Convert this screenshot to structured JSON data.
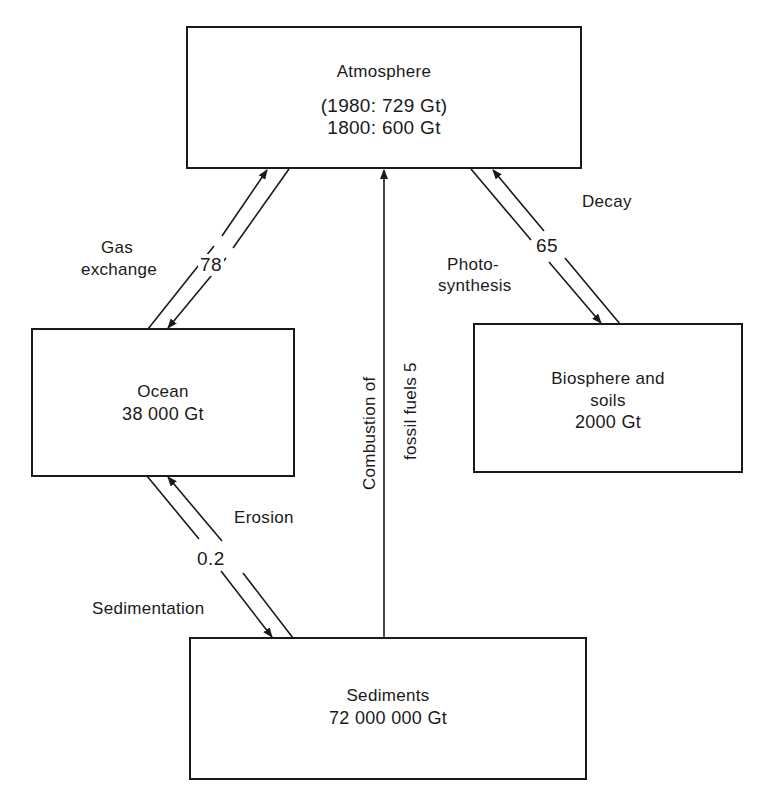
{
  "diagram": {
    "type": "carbon-cycle-flow",
    "colors": {
      "ink": "#1a1a1a",
      "background": "#ffffff"
    },
    "nodes": {
      "atmosphere": {
        "title": "Atmosphere",
        "line1": "(1980: 729 Gt)",
        "line2": "1800: 600 Gt"
      },
      "ocean": {
        "title": "Ocean",
        "line1": "38 000 Gt"
      },
      "biosphere": {
        "title": "Biosphere and",
        "line1": "soils",
        "line2": "2000 Gt"
      },
      "sediments": {
        "title": "Sediments",
        "line1": "72 000 000 Gt"
      }
    },
    "flows": {
      "gas_exchange": {
        "label_line1": "Gas",
        "label_line2": "exchange",
        "value": "78",
        "from": "ocean",
        "to": "atmosphere",
        "bidirectional": true
      },
      "biosphere_exchange": {
        "decay_label": "Decay",
        "photosynthesis_line1": "Photo-",
        "photosynthesis_line2": "synthesis",
        "value": "65",
        "bidirectional": true
      },
      "sediment_exchange": {
        "erosion_label": "Erosion",
        "sedimentation_label": "Sedimentation",
        "value": "0.2",
        "bidirectional": true
      },
      "combustion": {
        "label_line1": "Combustion of",
        "label_line2": "fossil fuels 5",
        "from": "sediments",
        "to": "atmosphere"
      }
    }
  }
}
